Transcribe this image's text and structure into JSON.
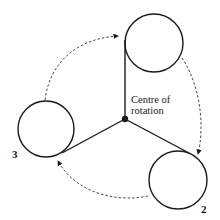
{
  "diagram": {
    "centre_label_line1": "Centre of",
    "centre_label_line2": "rotation",
    "circle_labels": {
      "top": "",
      "right": "2",
      "left": "3"
    },
    "stroke_color": "#1a1a1a",
    "dash_color": "#333333"
  }
}
